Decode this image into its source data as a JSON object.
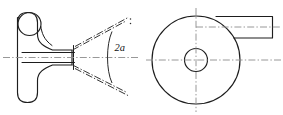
{
  "figure": {
    "background_color": "#ffffff",
    "line_color": "#1d1d1d",
    "centerline_color": "#8c8c8c",
    "labels": {
      "cone_angle": "2a"
    },
    "views": {
      "left": {
        "name": "side-section-view",
        "parts": [
          "body-outline",
          "top-circle",
          "bore-upper-line",
          "bore-lower-line",
          "axis-centerline",
          "nozzle-face",
          "spray-cone-upper",
          "spray-cone-lower",
          "angle-arc"
        ]
      },
      "right": {
        "name": "end-view",
        "parts": [
          "outer-circle",
          "center-bore-circle",
          "vertical-centerline",
          "horizontal-centerline",
          "tangent-rectangle",
          "rectangle-centerline"
        ]
      }
    }
  }
}
